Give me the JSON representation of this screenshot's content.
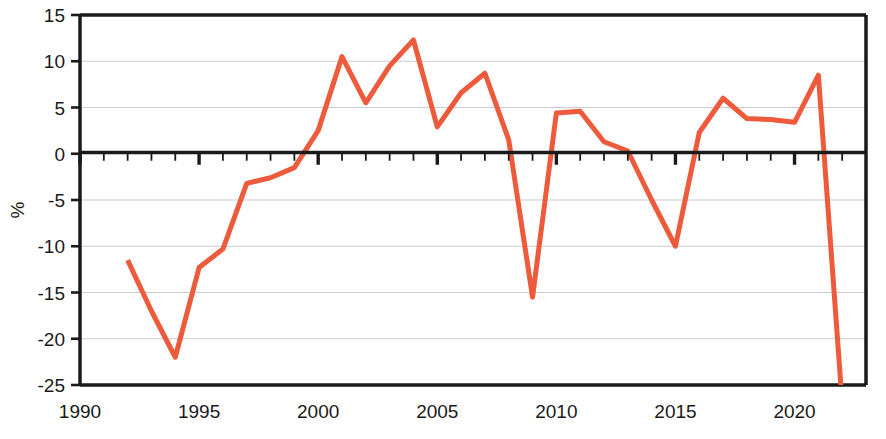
{
  "chart_data": {
    "type": "line",
    "title": "",
    "subtitle": "",
    "xlabel": "",
    "ylabel": "%",
    "xlim": [
      1990,
      2023
    ],
    "ylim": [
      -25,
      15
    ],
    "ytick_values": [
      15,
      10,
      5,
      0,
      -5,
      -10,
      -15,
      -20,
      -25
    ],
    "ytick_labels": [
      "15",
      "10",
      "5",
      "0",
      "-5",
      "-10",
      "-15",
      "-20",
      "-25"
    ],
    "xtick_values": [
      1990,
      1995,
      2000,
      2005,
      2010,
      2015,
      2020
    ],
    "xtick_labels": [
      "1990",
      "1995",
      "2000",
      "2005",
      "2010",
      "2015",
      "2020"
    ],
    "minor_xticks_every": 1,
    "grid": "horizontal",
    "legend": "none",
    "line_color": "#ee5a3c",
    "line_width": 5,
    "axis_color": "#1a1a1a",
    "grid_color": "#c8ccd0",
    "background": "#ffffff",
    "clipped_below_axis": true,
    "x": [
      1992,
      1993,
      1994,
      1995,
      1996,
      1997,
      1998,
      1999,
      2000,
      2001,
      2002,
      2003,
      2004,
      2005,
      2006,
      2007,
      2008,
      2009,
      2010,
      2011,
      2012,
      2013,
      2014,
      2015,
      2016,
      2017,
      2018,
      2019,
      2020,
      2021,
      2022
    ],
    "values": [
      -11.5,
      -17.0,
      -22.0,
      -12.3,
      -10.3,
      -3.2,
      -2.6,
      -1.5,
      2.5,
      10.5,
      5.5,
      9.5,
      12.3,
      2.9,
      6.6,
      8.7,
      1.5,
      -15.5,
      4.4,
      4.6,
      1.3,
      0.3,
      -5.0,
      -10.0,
      2.3,
      6.0,
      3.8,
      3.7,
      3.4,
      8.5,
      -27.0
    ],
    "annotations": []
  },
  "figure": {
    "ylabel": "%",
    "ytick_labels": [
      "15",
      "10",
      "5",
      "0",
      "-5",
      "-10",
      "-15",
      "-20",
      "-25"
    ],
    "xtick_labels": [
      "1990",
      "1995",
      "2000",
      "2005",
      "2010",
      "2015",
      "2020"
    ]
  }
}
